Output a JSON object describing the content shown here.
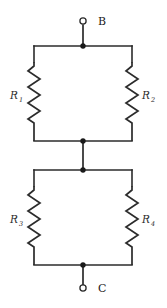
{
  "diagram": {
    "type": "electrical-circuit-schematic",
    "colors": {
      "background": "#ffffff",
      "wire": "#2b2b2b",
      "node": "#1a1a1a",
      "label": "#2b2b2b"
    },
    "terminals": [
      {
        "id": "top",
        "label": "B",
        "marker": "open-circle",
        "x": 83,
        "y": 21,
        "label_x": 98,
        "label_y": 21
      },
      {
        "id": "bottom",
        "label": "C",
        "marker": "open-circle",
        "x": 83,
        "y": 288,
        "label_x": 98,
        "label_y": 292
      }
    ],
    "junctions": [
      {
        "id": "top-rail-node",
        "x": 83,
        "y": 46
      },
      {
        "id": "mid-upper-node",
        "x": 83,
        "y": 141
      },
      {
        "id": "mid-lower-node",
        "x": 83,
        "y": 170
      },
      {
        "id": "bottom-rail-node",
        "x": 83,
        "y": 265
      }
    ],
    "resistors": [
      {
        "id": "r1",
        "label": "R",
        "subscript": "1",
        "position": "upper-left",
        "label_x": 14,
        "label_y": 96,
        "zig_x": 34,
        "zig_top": 62,
        "zig_bottom": 126
      },
      {
        "id": "r2",
        "label": "R",
        "subscript": "2",
        "position": "upper-right",
        "label_x": 138,
        "label_y": 96,
        "zig_x": 132,
        "zig_top": 62,
        "zig_bottom": 126
      },
      {
        "id": "r3",
        "label": "R",
        "subscript": "3",
        "position": "lower-left",
        "label_x": 14,
        "label_y": 220,
        "zig_x": 34,
        "zig_top": 186,
        "zig_bottom": 250
      },
      {
        "id": "r4",
        "label": "R",
        "subscript": "4",
        "position": "lower-right",
        "label_x": 138,
        "label_y": 220,
        "zig_x": 132,
        "zig_top": 186,
        "zig_bottom": 250
      }
    ],
    "blocks": [
      {
        "id": "upper-parallel-block",
        "left": 34,
        "right": 132,
        "top": 46,
        "bottom": 141
      },
      {
        "id": "lower-parallel-block",
        "left": 34,
        "right": 132,
        "top": 170,
        "bottom": 265
      }
    ]
  }
}
